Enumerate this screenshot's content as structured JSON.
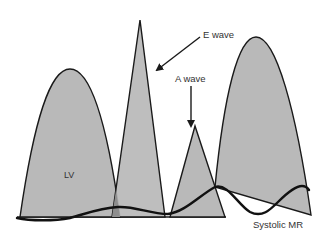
{
  "diagram": {
    "type": "doppler-flow-schematic",
    "colors": {
      "fill": "#b9b9b9",
      "stroke": "#1a1a1a",
      "text": "#333333",
      "background": "#ffffff"
    },
    "labels": {
      "e_wave": "E wave",
      "a_wave": "A wave",
      "lv": "LV",
      "systolic_mr": "Systolic MR"
    },
    "shapes": [
      {
        "id": "lv-systolic-envelope",
        "kind": "parabola"
      },
      {
        "id": "e-wave",
        "kind": "triangle"
      },
      {
        "id": "a-wave",
        "kind": "triangle"
      },
      {
        "id": "systolic-mr-envelope",
        "kind": "parabola"
      },
      {
        "id": "systolic-mr-curve",
        "kind": "wavy-line"
      }
    ],
    "annotations": [
      {
        "label": "E wave",
        "points_to": "e-wave"
      },
      {
        "label": "A wave",
        "points_to": "a-wave"
      }
    ]
  }
}
